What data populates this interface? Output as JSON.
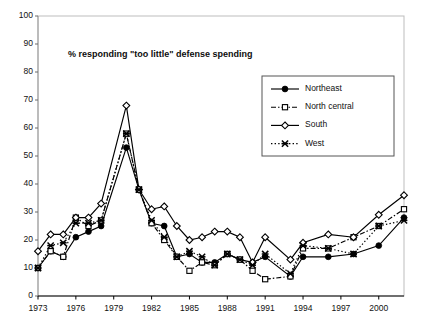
{
  "chart_data": {
    "type": "line",
    "title": "% responding \"too little\" defense spending",
    "xlabel": "",
    "ylabel": "",
    "xlim": [
      1973,
      2002
    ],
    "ylim": [
      0,
      100
    ],
    "ytick_step": 10,
    "yticks": [
      0,
      10,
      20,
      30,
      40,
      50,
      60,
      70,
      80,
      90,
      100
    ],
    "xticks": [
      1973,
      1976,
      1979,
      1982,
      1985,
      1988,
      1991,
      1994,
      1997,
      2000
    ],
    "xtick_labels": [
      "1973",
      "1976",
      "1979",
      "1982",
      "1985",
      "1988",
      "1991",
      "1994",
      "1997",
      "2000"
    ],
    "grid": false,
    "legend_position": "top-right",
    "x": [
      1973,
      1974,
      1975,
      1976,
      1977,
      1978,
      1980,
      1981,
      1982,
      1983,
      1984,
      1985,
      1986,
      1987,
      1988,
      1989,
      1990,
      1991,
      1993,
      1994,
      1996,
      1998,
      2000,
      2002
    ],
    "series": [
      {
        "name": "Northeast",
        "marker": "filled-circle",
        "dash": "solid",
        "color": "#000000",
        "values": [
          10,
          16,
          14,
          21,
          23,
          25,
          53,
          38,
          26,
          25,
          14,
          15,
          12,
          12,
          15,
          13,
          12,
          14,
          7,
          14,
          14,
          15,
          18,
          28
        ]
      },
      {
        "name": "North central",
        "marker": "open-square",
        "dash": "dash-dot",
        "color": "#000000",
        "values": [
          10,
          16,
          14,
          28,
          25,
          27,
          58,
          38,
          26,
          20,
          14,
          9,
          12,
          11,
          15,
          13,
          9,
          6,
          7,
          17,
          17,
          21,
          25,
          31
        ]
      },
      {
        "name": "South",
        "marker": "open-diamond",
        "dash": "solid",
        "color": "#000000",
        "values": [
          16,
          22,
          22,
          28,
          28,
          33,
          68,
          38,
          31,
          32,
          25,
          20,
          21,
          23,
          23,
          21,
          12,
          21,
          13,
          19,
          22,
          21,
          29,
          36
        ]
      },
      {
        "name": "West",
        "marker": "cross-x",
        "dash": "dotted",
        "color": "#000000",
        "values": [
          10,
          18,
          19,
          26,
          26,
          27,
          58,
          38,
          27,
          21,
          14,
          16,
          14,
          11,
          15,
          13,
          11,
          15,
          8,
          18,
          17,
          15,
          25,
          27
        ]
      }
    ],
    "legend": [
      {
        "label": "Northeast",
        "marker": "filled-circle",
        "dash": "solid"
      },
      {
        "label": "North central",
        "marker": "open-square",
        "dash": "dash-dot"
      },
      {
        "label": "South",
        "marker": "open-diamond",
        "dash": "solid"
      },
      {
        "label": "West",
        "marker": "cross-x",
        "dash": "dotted"
      }
    ],
    "axis_color": "#000000",
    "frame_color": "#bdbdbd",
    "background": "#ffffff"
  }
}
